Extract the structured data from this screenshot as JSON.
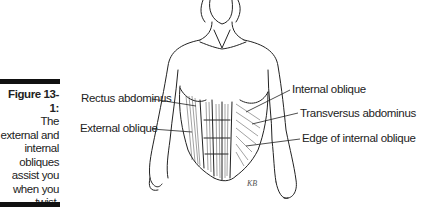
{
  "caption": {
    "figure_number": "Figure 13-1:",
    "text": "The external and internal obliques assist you when you twist."
  },
  "labels": {
    "rectus_abdominus": "Rectus abdominus",
    "external_oblique": "External oblique",
    "internal_oblique": "Internal oblique",
    "transversus_abdominus": "Transversus abdominus",
    "edge_internal_oblique": "Edge of internal oblique"
  },
  "signature": "KB"
}
